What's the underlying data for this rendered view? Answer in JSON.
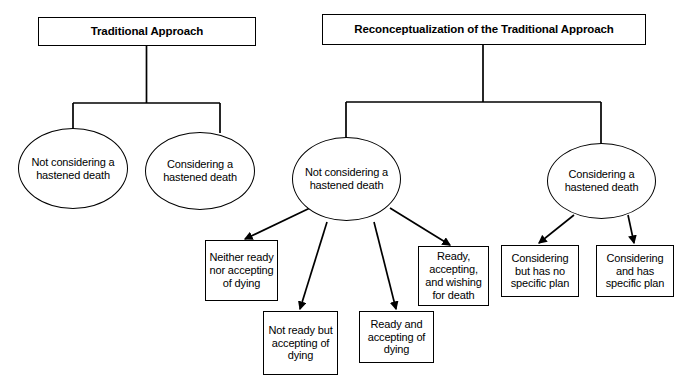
{
  "diagram": {
    "type": "tree-flowchart",
    "background_color": "#ffffff",
    "stroke_color": "#000000",
    "headers": [
      {
        "id": "traditional",
        "label": "Traditional Approach"
      },
      {
        "id": "reconceptualization",
        "label": "Reconceptualization of the Traditional Approach"
      }
    ],
    "ellipses": [
      {
        "id": "trad-not-considering",
        "label": "Not considering a hastened death"
      },
      {
        "id": "trad-considering",
        "label": "Considering a hastened death"
      },
      {
        "id": "recon-not-considering",
        "label": "Not considering a hastened death"
      },
      {
        "id": "recon-considering",
        "label": "Considering a hastened death"
      }
    ],
    "leaves": [
      {
        "id": "neither-ready-nor-accepting",
        "label": "Neither ready nor accepting of dying"
      },
      {
        "id": "not-ready-but-accepting",
        "label": "Not ready but accepting of dying"
      },
      {
        "id": "ready-and-accepting",
        "label": "Ready and accepting of dying"
      },
      {
        "id": "ready-accepting-wishing",
        "label": "Ready, accepting, and wishing for death"
      },
      {
        "id": "considering-no-plan",
        "label": "Considering but has no specific plan"
      },
      {
        "id": "considering-has-plan",
        "label": "Considering and has specific plan"
      }
    ]
  }
}
